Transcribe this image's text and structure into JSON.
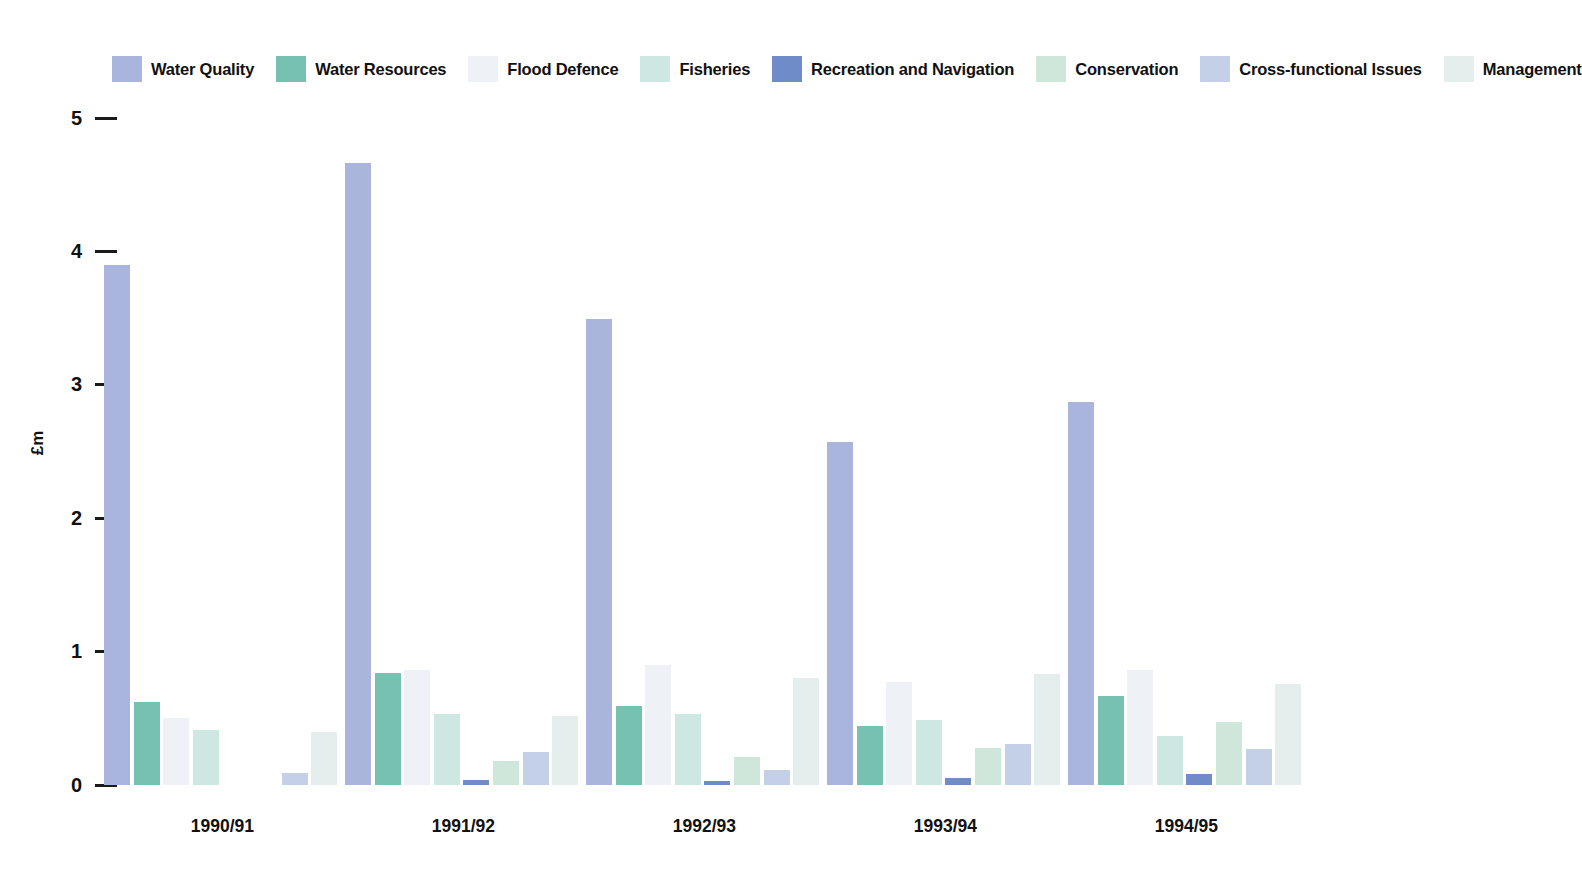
{
  "chart_data": {
    "type": "bar",
    "title": "",
    "subtitle": "",
    "xlabel": "",
    "ylabel": "£m",
    "ylim": [
      0,
      5
    ],
    "yticks": [
      0,
      1,
      2,
      3,
      4,
      5
    ],
    "ytick_labels": [
      "0",
      "1",
      "2",
      "3",
      "4",
      "5"
    ],
    "grid": false,
    "legend_position": "top",
    "categories": [
      "1990/91",
      "1991/92",
      "1992/93",
      "1993/94",
      "1994/95"
    ],
    "series": [
      {
        "name": "Water Quality",
        "color": "#a9b5dd",
        "values": [
          3.9,
          4.66,
          3.49,
          2.57,
          2.87
        ]
      },
      {
        "name": "Water Resources",
        "color": "#77c1b0",
        "values": [
          0.62,
          0.84,
          0.59,
          0.44,
          0.67
        ]
      },
      {
        "name": "Flood Defence",
        "color": "#eef2f6",
        "values": [
          0.5,
          0.86,
          0.9,
          0.77,
          0.86
        ]
      },
      {
        "name": "Fisheries",
        "color": "#cde8e2",
        "values": [
          0.41,
          0.53,
          0.53,
          0.49,
          0.37
        ]
      },
      {
        "name": "Recreation and Navigation",
        "color": "#6f8cc9",
        "values": [
          0.0,
          0.04,
          0.03,
          0.05,
          0.08
        ]
      },
      {
        "name": "Conservation",
        "color": "#cfe6db",
        "values": [
          0.0,
          0.18,
          0.21,
          0.28,
          0.47
        ]
      },
      {
        "name": "Cross-functional Issues",
        "color": "#c4d0e7",
        "values": [
          0.09,
          0.25,
          0.11,
          0.31,
          0.27
        ]
      },
      {
        "name": "Management",
        "color": "#e4efed",
        "values": [
          0.4,
          0.52,
          0.8,
          0.83,
          0.76
        ]
      }
    ]
  },
  "legend": {
    "items": [
      {
        "label": "Water Quality",
        "color": "#a9b5dd"
      },
      {
        "label": "Water Resources",
        "color": "#77c1b0"
      },
      {
        "label": "Flood Defence",
        "color": "#eef2f6"
      },
      {
        "label": "Fisheries",
        "color": "#cde8e2"
      },
      {
        "label": "Recreation and Navigation",
        "color": "#6f8cc9"
      },
      {
        "label": "Conservation",
        "color": "#cfe6db"
      },
      {
        "label": "Cross-functional Issues",
        "color": "#c4d0e7"
      },
      {
        "label": "Management",
        "color": "#e4efed"
      }
    ]
  },
  "axis": {
    "y_title": "£m"
  }
}
